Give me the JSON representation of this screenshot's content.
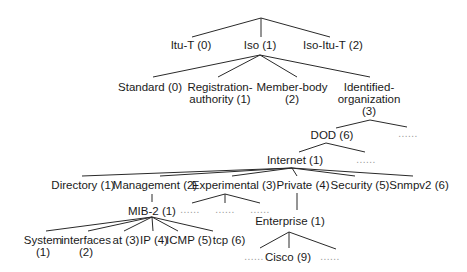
{
  "diagram": {
    "title": "",
    "nodes": {
      "itu_t": "Itu-T (0)",
      "iso": "Iso (1)",
      "iso_itu_t": "Iso-Itu-T (2)",
      "standard": "Standard (0)",
      "registration_1": "Registration-",
      "registration_2": "authority (1)",
      "member_1": "Member-body",
      "member_2": "(2)",
      "identified_1": "Identified-",
      "identified_2": "organization",
      "identified_3": "(3)",
      "dod": "DOD (6)",
      "internet": "Internet (1)",
      "directory": "Directory (1)",
      "management": "Management (2)",
      "experimental": "Experimental (3)",
      "private": "Private (4)",
      "security": "Security (5)",
      "snmpv2": "Snmpv2 (6)",
      "mib2": "MIB-2 (1)",
      "enterprise": "Enterprise (1)",
      "system_1": "System",
      "system_2": "(1)",
      "interfaces_1": "interfaces",
      "interfaces_2": "(2)",
      "at": "at (3)",
      "ip": "IP (4)",
      "icmp": "ICMP (5)",
      "tcp": "tcp (6)",
      "cisco": "Cisco (9)"
    },
    "ellipsis": "......",
    "edges": [
      [
        "root",
        "Itu-T (0)"
      ],
      [
        "root",
        "Iso (1)"
      ],
      [
        "root",
        "Iso-Itu-T (2)"
      ],
      [
        "Iso (1)",
        "Standard (0)"
      ],
      [
        "Iso (1)",
        "Registration-authority (1)"
      ],
      [
        "Iso (1)",
        "Member-body (2)"
      ],
      [
        "Iso (1)",
        "Identified-organization (3)"
      ],
      [
        "Identified-organization (3)",
        "DOD (6)"
      ],
      [
        "Identified-organization (3)",
        "..."
      ],
      [
        "DOD (6)",
        "Internet (1)"
      ],
      [
        "DOD (6)",
        "..."
      ],
      [
        "Internet (1)",
        "Directory (1)"
      ],
      [
        "Internet (1)",
        "Management (2)"
      ],
      [
        "Internet (1)",
        "Experimental (3)"
      ],
      [
        "Internet (1)",
        "Private (4)"
      ],
      [
        "Internet (1)",
        "Security (5)"
      ],
      [
        "Internet (1)",
        "Snmpv2 (6)"
      ],
      [
        "Management (2)",
        "MIB-2 (1)"
      ],
      [
        "Experimental (3)",
        "..."
      ],
      [
        "Experimental (3)",
        "..."
      ],
      [
        "Experimental (3)",
        "..."
      ],
      [
        "Private (4)",
        "Enterprise (1)"
      ],
      [
        "MIB-2 (1)",
        "System (1)"
      ],
      [
        "MIB-2 (1)",
        "interfaces (2)"
      ],
      [
        "MIB-2 (1)",
        "at (3)"
      ],
      [
        "MIB-2 (1)",
        "IP (4)"
      ],
      [
        "MIB-2 (1)",
        "ICMP (5)"
      ],
      [
        "MIB-2 (1)",
        "tcp (6)"
      ],
      [
        "Enterprise (1)",
        "..."
      ],
      [
        "Enterprise (1)",
        "Cisco (9)"
      ],
      [
        "Enterprise (1)",
        "..."
      ]
    ]
  }
}
